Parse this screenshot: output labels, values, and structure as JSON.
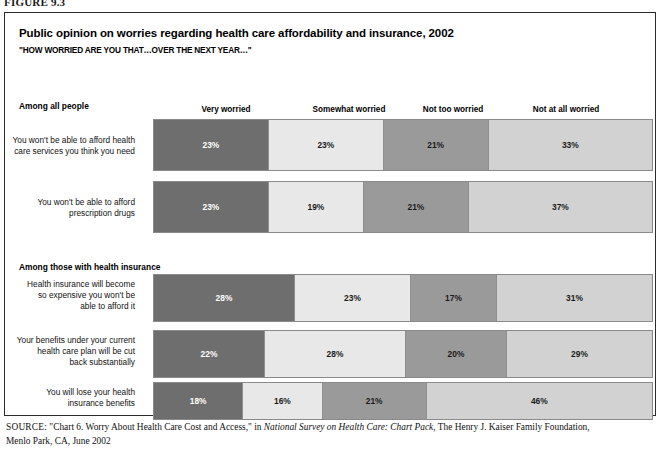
{
  "figure": {
    "number": "FIGURE 9.3"
  },
  "title": "Public opinion on worries regarding health care affordability and insurance, 2002",
  "subtitle": "\"HOW WORRIED ARE YOU THAT…OVER THE NEXT YEAR…\"",
  "sections": [
    {
      "id": "all-people",
      "label": "Among all people"
    },
    {
      "id": "insured",
      "label": "Among those with health insurance"
    }
  ],
  "column_headers": [
    {
      "label": "Very worried",
      "center_x": 225
    },
    {
      "label": "Somewhat worried",
      "center_x": 348
    },
    {
      "label": "Not too worried",
      "center_x": 452
    },
    {
      "label": "Not at all worried",
      "center_x": 565
    }
  ],
  "source": {
    "label": "SOURCE:",
    "line1_pre": " \"Chart 6. Worry About Health Care Cost and Access,\" in ",
    "line1_italic": "National Survey on Health Care: Chart Pack",
    "line1_post": ", The Henry J. Kaiser Family Foundation,",
    "line2": "Menlo Park, CA, June 2002"
  },
  "chart_data": {
    "type": "bar",
    "subtype": "stacked-horizontal-100",
    "title": "Public opinion on worries regarding health care affordability and insurance, 2002",
    "subtitle": "\"HOW WORRIED ARE YOU THAT…OVER THE NEXT YEAR…\"",
    "xlabel": "",
    "ylabel": "",
    "xlim": [
      0,
      100
    ],
    "grid": false,
    "legend_position": "top (column headers above bars)",
    "value_format": "percent",
    "categories": [
      "Very worried",
      "Somewhat worried",
      "Not too worried",
      "Not at all worried"
    ],
    "series_colors": [
      "#6e6e6e",
      "#e8e8e8",
      "#9a9a9a",
      "#d2d2d2"
    ],
    "groups": [
      {
        "group_label": "Among all people",
        "top": 117,
        "rows": [
          {
            "label": "You won't be able to afford health care services you think you need",
            "label_lines": [
              "You won't be able to afford health",
              "care services you think you need"
            ],
            "top": 118,
            "height": 52,
            "label_top": 134,
            "values": [
              23,
              23,
              21,
              33
            ],
            "value_labels": [
              "23%",
              "23%",
              "21%",
              "33%"
            ]
          },
          {
            "label": "You won't be able to afford prescription drugs",
            "label_lines": [
              "You won't be able to afford",
              "prescription drugs"
            ],
            "top": 180,
            "height": 52,
            "label_top": 196,
            "values": [
              23,
              19,
              21,
              37
            ],
            "value_labels": [
              "23%",
              "19%",
              "21%",
              "37%"
            ]
          }
        ]
      },
      {
        "group_label": "Among those with health insurance",
        "top": 270,
        "rows": [
          {
            "label": "Health insurance will become so expensive you won't be able to afford it",
            "label_lines": [
              "Health insurance will become",
              "so expensive you won't be",
              "able to afford it"
            ],
            "top": 273,
            "height": 48,
            "label_top": 278,
            "values": [
              28,
              23,
              17,
              31
            ],
            "value_labels": [
              "28%",
              "23%",
              "17%",
              "31%"
            ]
          },
          {
            "label": "Your benefits under your current health care plan will be cut back substantially",
            "label_lines": [
              "Your benefits under your current",
              "health care plan will be cut",
              "back substantially"
            ],
            "top": 329,
            "height": 48,
            "label_top": 334,
            "values": [
              22,
              28,
              20,
              29
            ],
            "value_labels": [
              "22%",
              "28%",
              "20%",
              "29%"
            ]
          },
          {
            "label": "You will lose your health insurance benefits",
            "label_lines": [
              "You will lose your health",
              "insurance benefits"
            ],
            "top": 381,
            "height": 38,
            "label_top": 386,
            "values": [
              18,
              16,
              21,
              46
            ],
            "value_labels": [
              "18%",
              "16%",
              "21%",
              "46%"
            ]
          }
        ]
      }
    ]
  }
}
